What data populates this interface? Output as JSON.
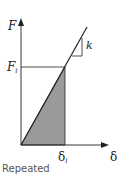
{
  "diagram": {
    "type": "force-displacement",
    "y_axis_label": "F",
    "x_axis_label": "δ",
    "force_level": {
      "base": "F",
      "sub": "i"
    },
    "displacement_level": {
      "base": "δ",
      "sub": "i"
    },
    "slope_label": "k",
    "caption": "Repeated",
    "colors": {
      "axis": "#222222",
      "shaded_area": "#9a9a9a",
      "line": "#222222"
    }
  }
}
